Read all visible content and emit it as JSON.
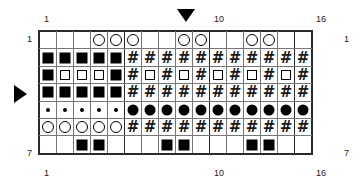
{
  "chart_data": {
    "type": "table",
    "columns": 16,
    "rows": 7,
    "repeat_separators_after_columns": [
      5,
      10,
      15
    ],
    "column_tick_labels_top": [
      "1",
      "10",
      "16"
    ],
    "column_tick_labels_bottom": [
      "1",
      "10",
      "16"
    ],
    "row_labels_left": [
      "1",
      "7"
    ],
    "row_labels_right": [
      "1",
      "7"
    ],
    "markers": [
      {
        "name": "column-marker",
        "glyph": "triangle-down",
        "column": 9,
        "position": "top"
      },
      {
        "name": "row-marker",
        "glyph": "triangle-right",
        "row": 4,
        "position": "left"
      }
    ],
    "symbol_legend": {
      "blank": "blank",
      "filled-square": "filled square",
      "open-square": "open square",
      "open-circle": "open circle",
      "filled-circle": "filled circle",
      "small-dot": "small dot",
      "hash": "#"
    },
    "grid": [
      [
        "blank",
        "blank",
        "blank",
        "open-circle",
        "open-circle",
        "open-circle",
        "blank",
        "blank",
        "open-circle",
        "open-circle",
        "blank",
        "blank",
        "open-circle",
        "open-circle",
        "blank",
        "blank"
      ],
      [
        "filled-square",
        "filled-square",
        "filled-square",
        "filled-square",
        "filled-square",
        "hash",
        "hash",
        "hash",
        "hash",
        "hash",
        "hash",
        "hash",
        "hash",
        "hash",
        "hash",
        "hash"
      ],
      [
        "filled-square",
        "open-square",
        "open-square",
        "open-square",
        "filled-square",
        "hash",
        "open-square",
        "hash",
        "open-square",
        "hash",
        "open-square",
        "hash",
        "open-square",
        "hash",
        "open-square",
        "hash"
      ],
      [
        "filled-square",
        "filled-square",
        "filled-square",
        "filled-square",
        "filled-square",
        "hash",
        "hash",
        "hash",
        "hash",
        "hash",
        "hash",
        "hash",
        "hash",
        "hash",
        "hash",
        "hash"
      ],
      [
        "small-dot",
        "small-dot",
        "small-dot",
        "small-dot",
        "small-dot",
        "filled-circle",
        "filled-circle",
        "filled-circle",
        "filled-circle",
        "filled-circle",
        "filled-circle",
        "filled-circle",
        "filled-circle",
        "filled-circle",
        "filled-circle",
        "filled-circle"
      ],
      [
        "open-circle",
        "open-circle",
        "open-circle",
        "open-circle",
        "open-circle",
        "hash",
        "hash",
        "hash",
        "hash",
        "hash",
        "hash",
        "hash",
        "hash",
        "hash",
        "hash",
        "hash"
      ],
      [
        "blank",
        "blank",
        "filled-square",
        "filled-square",
        "blank",
        "blank",
        "blank",
        "filled-square",
        "filled-square",
        "blank",
        "blank",
        "blank",
        "filled-square",
        "filled-square",
        "blank",
        "blank"
      ]
    ]
  },
  "labels": {
    "top_left": "1",
    "top_ten": "10",
    "top_right": "16",
    "bottom_left": "1",
    "bottom_ten": "10",
    "bottom_right": "16",
    "left_row_first": "1",
    "left_row_last": "7",
    "right_row_first": "1",
    "right_row_last": "7"
  },
  "colors": {
    "ink": "#000000",
    "grid_line": "#777777",
    "grid_border": "#2b2b2b",
    "background": "#ffffff"
  }
}
